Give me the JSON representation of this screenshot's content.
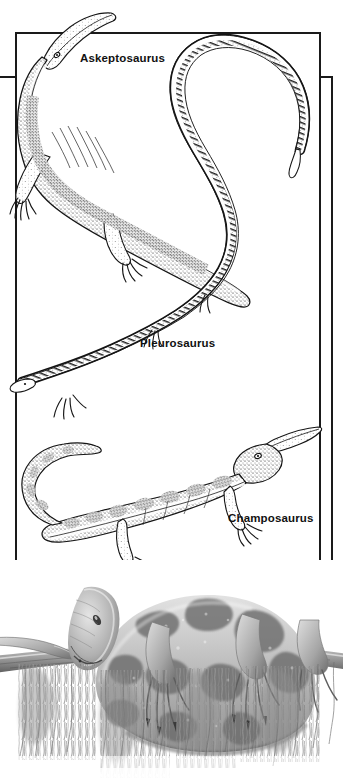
{
  "figure": {
    "kind": "scientific-illustration-plate",
    "background_color": "#ffffff",
    "frame_color": "#1a1a1a",
    "panel": {
      "name": "line-art-panel",
      "species": [
        {
          "id": "askeptosaurus",
          "label": "Askeptosaurus",
          "style": "stipple-line-drawing",
          "description": "long-snouted marine reptile, four limbs, long tapering tail, body angled from upper-left to lower-right"
        },
        {
          "id": "pleurosaurus",
          "label": "Pleurosaurus",
          "style": "stipple-line-drawing",
          "description": "extremely elongated eel-like reptile with tiny limbs and a tail curving up and over the top of the panel"
        },
        {
          "id": "champosaurus",
          "label": "Champosaurus",
          "style": "stipple-line-drawing",
          "description": "crocodile-like reptile with narrow snout, spotted flanks, sprawling limbs and a long curved tail"
        }
      ]
    },
    "bottom_illustration": {
      "name": "lizard-on-branch",
      "style": "grayscale-tonal-illustration",
      "description": "large mottled lizard resting along a horizontal branch with hanging moss and a smaller lizard head at left"
    }
  },
  "colors": {
    "ink": "#1a1a1a",
    "paper": "#ffffff",
    "label_text": "#111111",
    "tone_light": "#d8d8d8",
    "tone_mid": "#9a9a9a",
    "tone_dark": "#5a5a5a",
    "tone_darkest": "#2e2e2e"
  }
}
